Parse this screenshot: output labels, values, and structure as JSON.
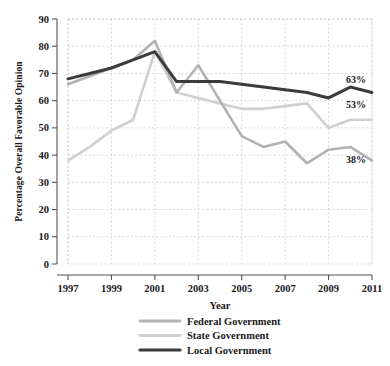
{
  "chart_data": {
    "type": "line",
    "title": "",
    "xlabel": "Year",
    "ylabel": "Percentage Overall Favorable Opinion",
    "xlim": [
      1997,
      2011
    ],
    "ylim": [
      0,
      90
    ],
    "grid": true,
    "legend_position": "bottom",
    "x": [
      1997,
      1998,
      1999,
      2000,
      2001,
      2002,
      2003,
      2004,
      2005,
      2006,
      2007,
      2008,
      2009,
      2010,
      2011
    ],
    "xtick_labels": [
      "1997",
      "1999",
      "2001",
      "2003",
      "2005",
      "2007",
      "2009",
      "2011"
    ],
    "xticks": [
      1997,
      1999,
      2001,
      2003,
      2005,
      2007,
      2009,
      2011
    ],
    "ytick_labels": [
      "0",
      "10",
      "20",
      "30",
      "40",
      "50",
      "60",
      "70",
      "80",
      "90"
    ],
    "yticks": [
      0,
      10,
      20,
      30,
      40,
      50,
      60,
      70,
      80,
      90
    ],
    "series": [
      {
        "name": "Federal Government",
        "color": "#b2b2b2",
        "values": [
          66,
          69,
          72,
          75,
          82,
          63,
          73,
          60,
          47,
          43,
          45,
          37,
          42,
          43,
          38
        ]
      },
      {
        "name": "State Government",
        "color": "#cfcfcf",
        "values": [
          38,
          43,
          49,
          53,
          78,
          63,
          61,
          59,
          57,
          57,
          58,
          59,
          50,
          53,
          53
        ]
      },
      {
        "name": "Local Government",
        "color": "#3b3b3b",
        "values": [
          68,
          70,
          72,
          75,
          78,
          67,
          67,
          67,
          66,
          65,
          64,
          63,
          61,
          65,
          63
        ]
      }
    ],
    "annotations": [
      {
        "label": "63%",
        "series": "Local Government",
        "value": 63,
        "x": 2011
      },
      {
        "label": "53%",
        "series": "State Government",
        "value": 53,
        "x": 2011
      },
      {
        "label": "38%",
        "series": "Federal Government",
        "value": 38,
        "x": 2011
      }
    ]
  },
  "legend": {
    "items": [
      {
        "label": "Federal Government",
        "color": "#b2b2b2"
      },
      {
        "label": "State Government",
        "color": "#cfcfcf"
      },
      {
        "label": "Local Government",
        "color": "#3b3b3b"
      }
    ]
  },
  "axes": {
    "x_title": "Year",
    "y_title": "Percentage Overall Favorable Opinion"
  }
}
